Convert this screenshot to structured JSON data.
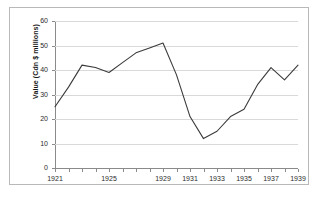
{
  "chart_data": {
    "type": "line",
    "title": "",
    "xlabel": "",
    "ylabel": "Value (Cdn $ millions)",
    "xlim": [
      1921,
      1939
    ],
    "ylim": [
      0,
      60
    ],
    "grid": true,
    "legend": false,
    "y_ticks": [
      0,
      10,
      20,
      30,
      40,
      50,
      60
    ],
    "x_tick_labels": [
      "1921",
      "1925",
      "1929",
      "1931",
      "1933",
      "1935",
      "1937",
      "1939"
    ],
    "x_tick_years": [
      1921,
      1925,
      1929,
      1931,
      1933,
      1935,
      1937,
      1939
    ],
    "x": [
      1921,
      1922,
      1923,
      1924,
      1925,
      1926,
      1927,
      1928,
      1929,
      1930,
      1931,
      1932,
      1933,
      1934,
      1935,
      1936,
      1937,
      1938,
      1939
    ],
    "values": [
      25,
      33,
      42,
      41,
      39,
      43,
      47,
      49,
      51,
      38,
      21,
      12,
      15,
      21,
      24,
      34,
      41,
      36,
      42
    ],
    "series": [
      {
        "name": "Value",
        "color": "#3b3b3b",
        "values": [
          25,
          33,
          42,
          41,
          39,
          43,
          47,
          49,
          51,
          38,
          21,
          12,
          15,
          21,
          24,
          34,
          41,
          36,
          42
        ]
      }
    ]
  },
  "axes": {
    "y_title": "Value (Cdn $ millions)"
  },
  "colors": {
    "line": "#3b3b3b",
    "grid": "#d9d9d9",
    "axis": "#8a8a8a",
    "frame": "#b9b9b9",
    "background": "#ffffff",
    "text": "#2b2b2b"
  }
}
